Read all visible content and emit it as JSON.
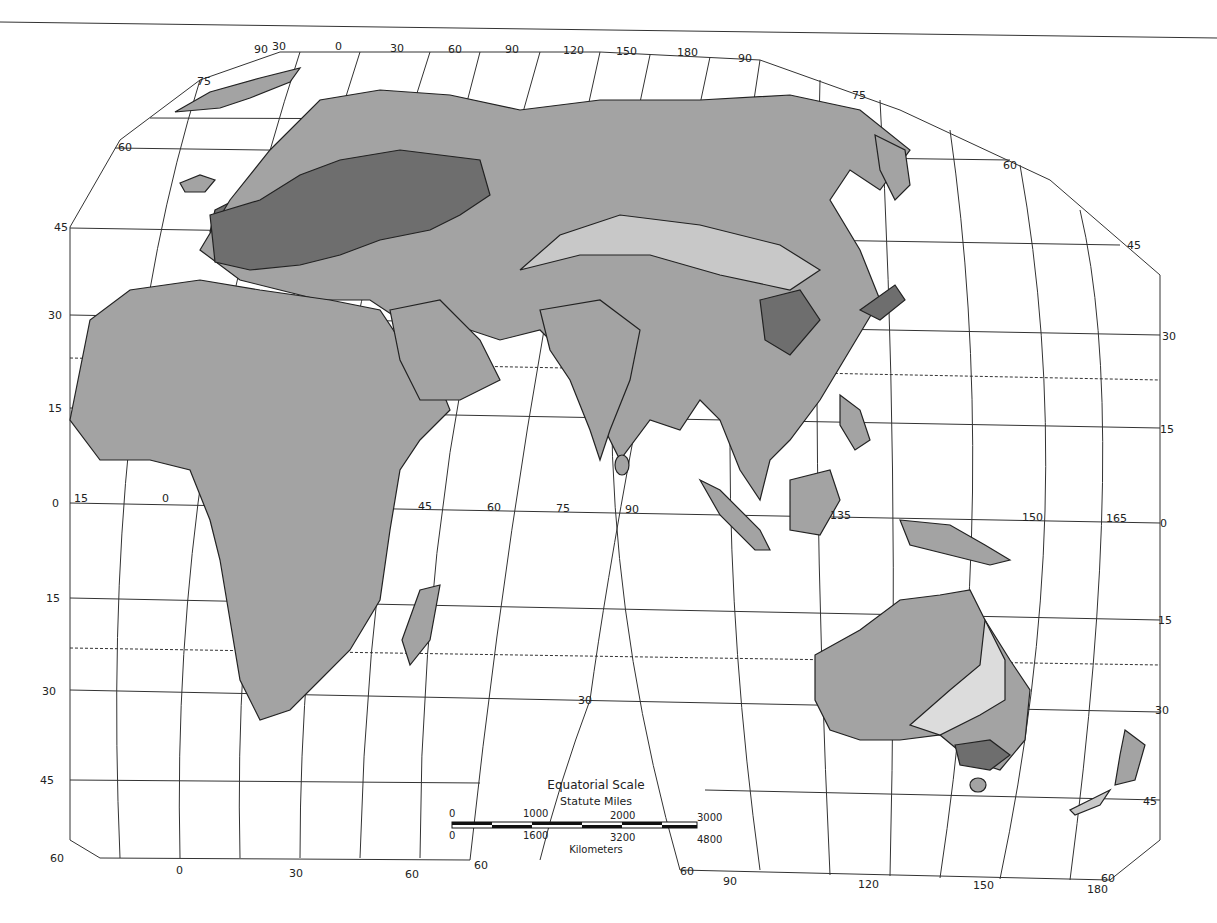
{
  "map": {
    "projection": "interrupted equal-area (Eastern Hemisphere lobe)",
    "colors": {
      "background": "#ffffff",
      "grid": "#333333",
      "coast": "#222222",
      "shade_light": "#c8c8c8",
      "shade_medium": "#a3a3a3",
      "shade_dark": "#6e6e6e",
      "shade_pale": "#dcdcdc"
    },
    "top_labels": [
      "90",
      "30",
      "0",
      "30",
      "60",
      "90",
      "120",
      "150",
      "180",
      "90"
    ],
    "left_lat_labels": [
      "75",
      "60",
      "45",
      "30",
      "15",
      "0",
      "15",
      "30",
      "45",
      "60"
    ],
    "right_lat_labels": [
      "75",
      "60",
      "45",
      "30",
      "15",
      "0",
      "15",
      "30",
      "45"
    ],
    "equator_lon_labels": [
      "15",
      "0",
      "45",
      "60",
      "75",
      "90",
      "135",
      "150",
      "165"
    ],
    "bottom_left_labels": [
      "0",
      "30",
      "60",
      "60"
    ],
    "bottom_right_labels": [
      "60",
      "90",
      "120",
      "150",
      "180",
      "60"
    ],
    "interior_label": "30"
  },
  "scale": {
    "title": "Equatorial Scale",
    "miles_label": "Statute Miles",
    "miles_ticks": [
      "0",
      "1000",
      "2000",
      "3000"
    ],
    "km_ticks": [
      "0",
      "1600",
      "3200",
      "4800"
    ],
    "km_label": "Kilometers"
  }
}
